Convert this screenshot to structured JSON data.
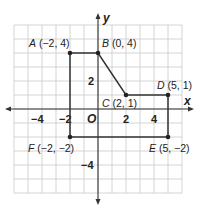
{
  "diagram": {
    "type": "coordinate-plane",
    "origin_px": [
      98,
      109
    ],
    "unit_px": 14,
    "x_range": [
      -6,
      6
    ],
    "y_range": [
      -6,
      6
    ],
    "axis_labels": {
      "x": "x",
      "y": "y",
      "origin": "O"
    },
    "x_ticks": [
      {
        "value": -4,
        "label": "−4"
      },
      {
        "value": -2,
        "label": "−2"
      },
      {
        "value": 2,
        "label": "2"
      },
      {
        "value": 4,
        "label": "4"
      }
    ],
    "y_ticks": [
      {
        "value": 2,
        "label": "2"
      },
      {
        "value": -4,
        "label": "−4"
      }
    ],
    "points": [
      {
        "name": "A",
        "coords": "(−2, 4)",
        "x": -2,
        "y": 4
      },
      {
        "name": "B",
        "coords": "(0, 4)",
        "x": 0,
        "y": 4
      },
      {
        "name": "C",
        "coords": "(2, 1)",
        "x": 2,
        "y": 1
      },
      {
        "name": "D",
        "coords": "(5, 1)",
        "x": 5,
        "y": 1
      },
      {
        "name": "E",
        "coords": "(5, −2)",
        "x": 5,
        "y": -2
      },
      {
        "name": "F",
        "coords": "(−2, −2)",
        "x": -2,
        "y": -2
      }
    ],
    "colors": {
      "grid": "#c9c9c9",
      "axis": "#333333",
      "shape": "#333333"
    }
  }
}
